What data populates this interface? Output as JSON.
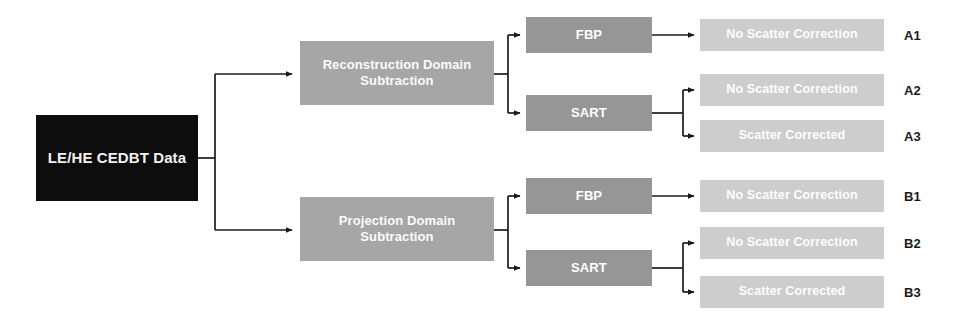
{
  "diagram": {
    "root": {
      "label": "LE/HE CEDBT Data",
      "color": "#0d0d0d"
    },
    "domains": [
      {
        "id": "recon",
        "label": "Reconstruction Domain\nSubtraction",
        "color": "#a6a6a6"
      },
      {
        "id": "proj",
        "label": "Projection Domain\nSubtraction",
        "color": "#a6a6a6"
      }
    ],
    "methods": [
      {
        "id": "fbp-a",
        "label": "FBP",
        "color": "#969696"
      },
      {
        "id": "sart-a",
        "label": "SART",
        "color": "#969696"
      },
      {
        "id": "fbp-b",
        "label": "FBP",
        "color": "#969696"
      },
      {
        "id": "sart-b",
        "label": "SART",
        "color": "#969696"
      }
    ],
    "outputs": [
      {
        "id": "a1",
        "label": "No Scatter Correction",
        "tag": "A1",
        "color": "#cdcdcd"
      },
      {
        "id": "a2",
        "label": "No Scatter Correction",
        "tag": "A2",
        "color": "#cdcdcd"
      },
      {
        "id": "a3",
        "label": "Scatter Corrected",
        "tag": "A3",
        "color": "#cdcdcd"
      },
      {
        "id": "b1",
        "label": "No Scatter Correction",
        "tag": "B1",
        "color": "#cdcdcd"
      },
      {
        "id": "b2",
        "label": "No Scatter Correction",
        "tag": "B2",
        "color": "#cdcdcd"
      },
      {
        "id": "b3",
        "label": "Scatter Corrected",
        "tag": "B3",
        "color": "#cdcdcd"
      }
    ],
    "connector_color": "#1a1a1a"
  }
}
